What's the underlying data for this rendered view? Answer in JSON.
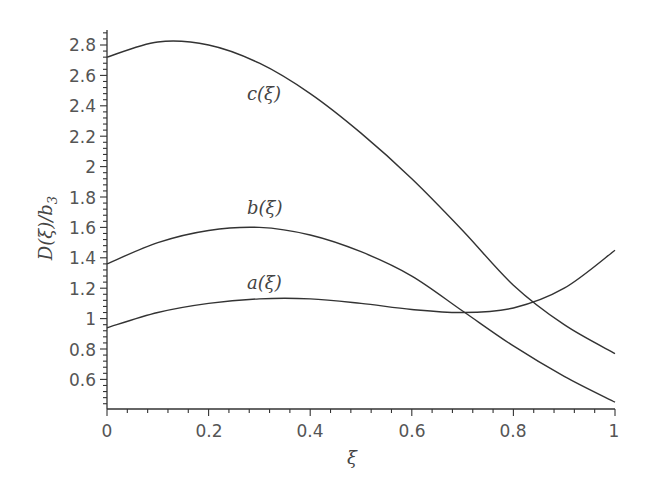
{
  "chart_data": {
    "type": "line",
    "title": "",
    "xlabel": "ξ",
    "ylabel": "D(ξ)/b3",
    "xlim": [
      0,
      1
    ],
    "ylim": [
      0.41,
      2.9
    ],
    "grid": false,
    "legend": "none (inline curve labels)",
    "x_ticks": [
      "0",
      "0.2",
      "0.4",
      "0.6",
      "0.8",
      "1"
    ],
    "y_ticks": [
      "0.6",
      "0.8",
      "1",
      "1.2",
      "1.4",
      "1.6",
      "1.8",
      "2",
      "2.2",
      "2.4",
      "2.6",
      "2.8"
    ],
    "x": [
      0,
      0.1,
      0.2,
      0.3,
      0.4,
      0.5,
      0.6,
      0.7,
      0.8,
      0.9,
      1.0
    ],
    "series": [
      {
        "name": "a(ξ)",
        "values": [
          0.94,
          1.04,
          1.1,
          1.13,
          1.13,
          1.1,
          1.06,
          1.04,
          1.07,
          1.2,
          1.45
        ]
      },
      {
        "name": "b(ξ)",
        "values": [
          1.36,
          1.5,
          1.58,
          1.6,
          1.55,
          1.44,
          1.28,
          1.05,
          0.82,
          0.62,
          0.45
        ]
      },
      {
        "name": "c(ξ)",
        "values": [
          2.72,
          2.82,
          2.8,
          2.68,
          2.48,
          2.22,
          1.92,
          1.58,
          1.22,
          0.96,
          0.77
        ]
      }
    ],
    "annotations": [
      {
        "text": "c(ξ)",
        "x": 0.28,
        "y": 2.27
      },
      {
        "text": "b(ξ)",
        "x": 0.28,
        "y": 1.53
      },
      {
        "text": "a(ξ)",
        "x": 0.28,
        "y": 1.04
      }
    ]
  },
  "labels": {
    "x_axis": "ξ",
    "y_axis_main": "D(ξ)/b",
    "y_axis_sub": "3",
    "curve_a": "a(ξ)",
    "curve_b": "b(ξ)",
    "curve_c": "c(ξ)",
    "xt0": "0",
    "xt1": "0.2",
    "xt2": "0.4",
    "xt3": "0.6",
    "xt4": "0.8",
    "xt5": "1",
    "yt0": "0.6",
    "yt1": "0.8",
    "yt2": "1",
    "yt3": "1.2",
    "yt4": "1.4",
    "yt5": "1.6",
    "yt6": "1.8",
    "yt7": "2",
    "yt8": "2.2",
    "yt9": "2.4",
    "yt10": "2.6",
    "yt11": "2.8"
  }
}
